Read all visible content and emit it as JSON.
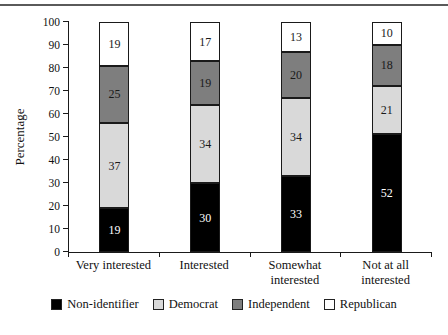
{
  "chart_data": {
    "type": "bar",
    "stacked": true,
    "categories": [
      "Very interested",
      "Interested",
      "Somewhat\ninterested",
      "Not at all\ninterested"
    ],
    "series": [
      {
        "name": "Non-identifier",
        "color": "#000000",
        "label_color": "#ffffff",
        "values": [
          19,
          30,
          33,
          52
        ]
      },
      {
        "name": "Democrat",
        "color": "#d9d9d9",
        "label_color": "#1a1a1a",
        "values": [
          37,
          34,
          34,
          21
        ]
      },
      {
        "name": "Independent",
        "color": "#7e7e7e",
        "label_color": "#1a1a1a",
        "values": [
          25,
          19,
          20,
          18
        ]
      },
      {
        "name": "Republican",
        "color": "#ffffff",
        "label_color": "#1a1a1a",
        "values": [
          19,
          17,
          13,
          10
        ]
      }
    ],
    "title": "",
    "xlabel": "",
    "ylabel": "Percentage",
    "ylim": [
      0,
      100
    ],
    "ytick_step": 10,
    "grid": false,
    "legend_position": "bottom",
    "axis_color": "#1a1a1a"
  }
}
